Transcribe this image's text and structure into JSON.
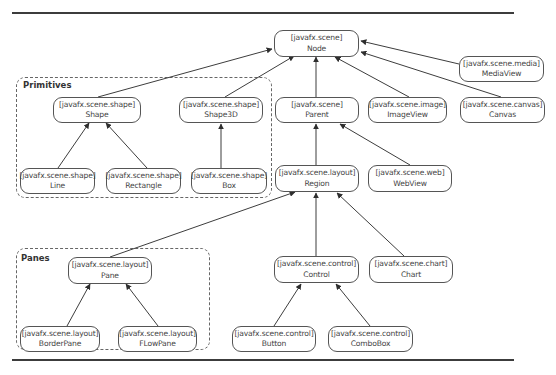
{
  "diagram": {
    "groups": [
      {
        "id": "primitives",
        "label": "Primitives"
      },
      {
        "id": "panes",
        "label": "Panes"
      }
    ],
    "nodes": {
      "node": {
        "package": "[javafx.scene]",
        "name": "Node"
      },
      "mediaview": {
        "package": "[javafx.scene.media]",
        "name": "MediaView"
      },
      "shape": {
        "package": "[javafx.scene.shape]",
        "name": "Shape"
      },
      "shape3d": {
        "package": "[javafx.scene.shape]",
        "name": "Shape3D"
      },
      "parent": {
        "package": "[javafx.scene]",
        "name": "Parent"
      },
      "imageview": {
        "package": "[javafx.scene.image]",
        "name": "ImageView"
      },
      "canvas": {
        "package": "[javafx.scene.canvas]",
        "name": "Canvas"
      },
      "line": {
        "package": "[javafx.scene.shape]",
        "name": "Line"
      },
      "rectangle": {
        "package": "[javafx.scene.shape]",
        "name": "Rectangle"
      },
      "box": {
        "package": "[javafx.scene.shape]",
        "name": "Box"
      },
      "region": {
        "package": "[javafx.scene.layout]",
        "name": "Region"
      },
      "webview": {
        "package": "[javafx.scene.web]",
        "name": "WebView"
      },
      "pane": {
        "package": "[javafx.scene.layout]",
        "name": "Pane"
      },
      "control": {
        "package": "[javafx.scene.control]",
        "name": "Control"
      },
      "chart": {
        "package": "[javafx.scene.chart]",
        "name": "Chart"
      },
      "borderpane": {
        "package": "[javafx.scene.layout]",
        "name": "BorderPane"
      },
      "flowpane": {
        "package": "[javafx.scene.layout]",
        "name": "FLowPane"
      },
      "button": {
        "package": "[javafx.scene.control]",
        "name": "Button"
      },
      "combobox": {
        "package": "[javafx.scene.control]",
        "name": "ComboBox"
      }
    },
    "edges": [
      {
        "from": "shape",
        "to": "node"
      },
      {
        "from": "shape3d",
        "to": "node"
      },
      {
        "from": "parent",
        "to": "node"
      },
      {
        "from": "imageview",
        "to": "node"
      },
      {
        "from": "canvas",
        "to": "node"
      },
      {
        "from": "mediaview",
        "to": "node"
      },
      {
        "from": "line",
        "to": "shape"
      },
      {
        "from": "rectangle",
        "to": "shape"
      },
      {
        "from": "box",
        "to": "shape3d"
      },
      {
        "from": "region",
        "to": "parent"
      },
      {
        "from": "webview",
        "to": "parent"
      },
      {
        "from": "pane",
        "to": "region"
      },
      {
        "from": "control",
        "to": "region"
      },
      {
        "from": "chart",
        "to": "region"
      },
      {
        "from": "borderpane",
        "to": "pane"
      },
      {
        "from": "flowpane",
        "to": "pane"
      },
      {
        "from": "button",
        "to": "control"
      },
      {
        "from": "combobox",
        "to": "control"
      }
    ],
    "colors": {
      "stroke": "#3d3d3d",
      "text": "#444444",
      "background": "#ffffff"
    }
  }
}
